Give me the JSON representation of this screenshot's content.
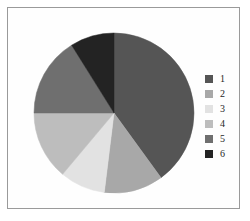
{
  "figure": {
    "width": 250,
    "height": 221,
    "background_color": "#ffffff",
    "frame_border_color": "#9a9a9a"
  },
  "chart_data": {
    "type": "pie",
    "title": "",
    "xlabel": "",
    "ylabel": "",
    "grid": false,
    "legend_position": "right",
    "start_angle_deg": 0,
    "direction": "clockwise",
    "center": {
      "x": 86,
      "y": 93
    },
    "radius": 80,
    "categories": [
      "1",
      "2",
      "3",
      "4",
      "5",
      "6"
    ],
    "values": [
      40,
      12,
      9,
      14,
      16,
      9
    ],
    "colors": [
      "#555555",
      "#a8a8a8",
      "#e2e2e2",
      "#bdbdbd",
      "#6f6f6f",
      "#232323"
    ],
    "slices": [
      {
        "label": "1",
        "value": 40,
        "color": "#555555",
        "start_deg": 0,
        "end_deg": 144
      },
      {
        "label": "2",
        "value": 12,
        "color": "#a8a8a8",
        "start_deg": 144,
        "end_deg": 187
      },
      {
        "label": "3",
        "value": 9,
        "color": "#e2e2e2",
        "start_deg": 187,
        "end_deg": 220
      },
      {
        "label": "4",
        "value": 14,
        "color": "#bdbdbd",
        "start_deg": 220,
        "end_deg": 270
      },
      {
        "label": "5",
        "value": 16,
        "color": "#6f6f6f",
        "start_deg": 270,
        "end_deg": 328
      },
      {
        "label": "6",
        "value": 9,
        "color": "#232323",
        "start_deg": 328,
        "end_deg": 360
      }
    ]
  },
  "legend": {
    "items": [
      {
        "label": "1",
        "color": "#555555"
      },
      {
        "label": "2",
        "color": "#a8a8a8"
      },
      {
        "label": "3",
        "color": "#e2e2e2"
      },
      {
        "label": "4",
        "color": "#bdbdbd"
      },
      {
        "label": "5",
        "color": "#6f6f6f"
      },
      {
        "label": "6",
        "color": "#232323"
      }
    ]
  }
}
